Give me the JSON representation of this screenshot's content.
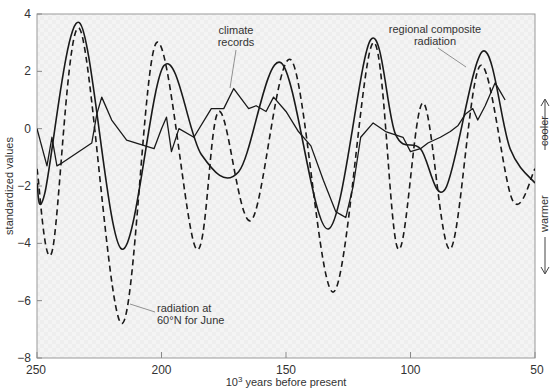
{
  "chart_data": {
    "type": "line",
    "title": "",
    "xlabel": "10^3 years before present",
    "xlabel_base": "10",
    "xlabel_exp": "3",
    "xlabel_rest": " years before present",
    "ylabel": "standardized values",
    "xlim": [
      250,
      50
    ],
    "ylim": [
      -8,
      4
    ],
    "x_ticks": [
      250,
      200,
      150,
      100,
      50
    ],
    "y_ticks": [
      4,
      2,
      0,
      -2,
      -4,
      -6,
      -8
    ],
    "grid": false,
    "side_annotations": {
      "up": "cooler",
      "down": "warmer"
    },
    "series": [
      {
        "name": "radiation at 60°N for June",
        "style": "dashed",
        "x": [
          250,
          244,
          233,
          216,
          202,
          186,
          177,
          164,
          148,
          131,
          115,
          105,
          95,
          84,
          72,
          59,
          50
        ],
        "values": [
          -1.4,
          -4.3,
          3.5,
          -6.8,
          3.0,
          -4.2,
          0.6,
          -3.2,
          2.4,
          -5.7,
          3.0,
          -4.2,
          0.9,
          -4.2,
          2.2,
          -2.5,
          -1.4
        ]
      },
      {
        "name": "regional composite radiation",
        "style": "solid-smooth",
        "x": [
          250,
          247,
          233,
          216,
          199,
          184,
          169,
          152,
          133,
          116,
          106,
          96,
          86,
          71,
          60,
          50
        ],
        "values": [
          -1.9,
          -2.3,
          3.7,
          -4.2,
          2.2,
          -0.9,
          -1.5,
          2.3,
          -3.5,
          3.1,
          -0.2,
          -0.7,
          -2.1,
          2.7,
          -0.7,
          -1.9
        ]
      },
      {
        "name": "climate records",
        "style": "solid-jagged",
        "x": [
          250,
          246,
          244,
          242,
          240,
          228,
          226,
          224,
          220,
          214,
          203,
          200,
          198,
          196,
          193,
          187,
          180,
          175,
          171,
          165,
          162,
          158,
          155,
          150,
          145,
          140,
          135,
          130,
          128,
          126,
          123,
          120,
          115,
          110,
          103,
          100,
          96,
          93,
          88,
          84,
          81,
          78,
          75,
          73,
          70,
          66,
          64,
          62
        ],
        "values": [
          0.0,
          -1.3,
          -0.3,
          -1.3,
          -1.2,
          -0.5,
          0.5,
          1.1,
          0.3,
          -0.4,
          -0.7,
          0.0,
          0.4,
          -0.8,
          0.0,
          -0.3,
          0.7,
          0.7,
          1.4,
          0.7,
          0.8,
          0.6,
          1.1,
          0.6,
          -0.1,
          -0.6,
          -1.8,
          -2.9,
          -3.0,
          -3.1,
          -2.0,
          -0.3,
          0.2,
          -0.1,
          -0.3,
          -0.8,
          -0.7,
          -0.5,
          -0.3,
          -0.1,
          0.1,
          0.5,
          0.7,
          0.3,
          0.8,
          1.6,
          1.3,
          1.0
        ]
      }
    ],
    "annotations": [
      {
        "text": [
          "climate",
          "records"
        ],
        "target_series": "climate records"
      },
      {
        "text": [
          "regional composite",
          "radiation"
        ],
        "target_series": "regional composite radiation"
      },
      {
        "text": [
          "radiation at",
          "60°N for June"
        ],
        "target_series": "radiation at 60°N for June"
      }
    ]
  },
  "colors": {
    "background": "#ffffff",
    "plot_bg": "#f3f3f3",
    "line": "#1a1a1a",
    "axis": "#888888",
    "text": "#333333"
  }
}
